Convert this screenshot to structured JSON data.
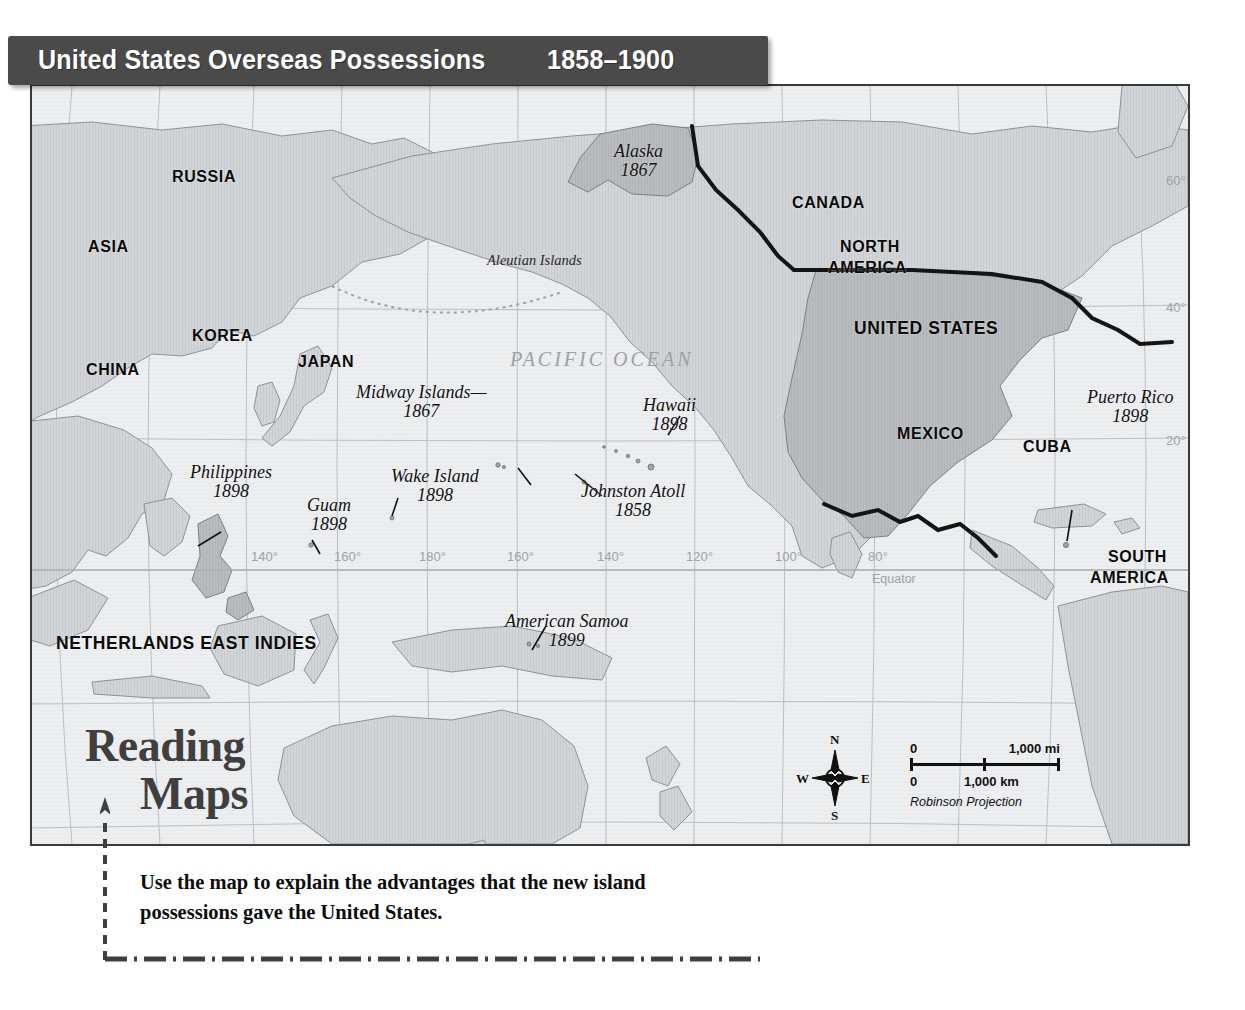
{
  "title": {
    "main": "United States Overseas Possessions",
    "years": "1858–1900"
  },
  "map": {
    "ocean_label": "PACIFIC OCEAN",
    "equator_label": "Equator",
    "projection": "Robinson Projection",
    "aleutian_label": "Aleutian Islands",
    "countries": [
      {
        "name": "RUSSIA",
        "x": 172,
        "y": 168
      },
      {
        "name": "ASIA",
        "x": 88,
        "y": 238
      },
      {
        "name": "KOREA",
        "x": 192,
        "y": 327
      },
      {
        "name": "CHINA",
        "x": 86,
        "y": 361
      },
      {
        "name": "JAPAN",
        "x": 298,
        "y": 353
      },
      {
        "name": "CANADA",
        "x": 792,
        "y": 194
      },
      {
        "name": "NORTH",
        "x": 840,
        "y": 238
      },
      {
        "name": "AMERICA",
        "x": 828,
        "y": 259
      },
      {
        "name": "UNITED STATES",
        "x": 854,
        "y": 318
      },
      {
        "name": "MEXICO",
        "x": 897,
        "y": 425
      },
      {
        "name": "CUBA",
        "x": 1023,
        "y": 438
      },
      {
        "name": "SOUTH",
        "x": 1108,
        "y": 548
      },
      {
        "name": "AMERICA",
        "x": 1090,
        "y": 569
      },
      {
        "name": "NETHERLANDS EAST INDIES",
        "x": 56,
        "y": 633
      }
    ],
    "possessions": [
      {
        "name": "Alaska",
        "year": "1867",
        "x": 614,
        "y": 142,
        "align": "center"
      },
      {
        "name": "Midway Islands—",
        "year": "1867",
        "x": 356,
        "y": 383,
        "align": "center"
      },
      {
        "name": "Hawaii",
        "year": "1898",
        "x": 643,
        "y": 396,
        "align": "center"
      },
      {
        "name": "Philippines",
        "year": "1898",
        "x": 190,
        "y": 463,
        "align": "center"
      },
      {
        "name": "Guam",
        "year": "1898",
        "x": 307,
        "y": 496,
        "align": "center"
      },
      {
        "name": "Wake Island",
        "year": "1898",
        "x": 391,
        "y": 467,
        "align": "center"
      },
      {
        "name": "Johnston Atoll",
        "year": "1858",
        "x": 581,
        "y": 482,
        "align": "center"
      },
      {
        "name": "American Samoa",
        "year": "1899",
        "x": 505,
        "y": 612,
        "align": "center"
      },
      {
        "name": "Puerto Rico",
        "year": "1898",
        "x": 1087,
        "y": 388,
        "align": "center"
      }
    ],
    "longitudes": [
      {
        "label": "140°",
        "x": 251,
        "y": 549
      },
      {
        "label": "160°",
        "x": 334,
        "y": 549
      },
      {
        "label": "180°",
        "x": 419,
        "y": 549
      },
      {
        "label": "160°",
        "x": 507,
        "y": 549
      },
      {
        "label": "140°",
        "x": 597,
        "y": 549
      },
      {
        "label": "120°",
        "x": 686,
        "y": 549
      },
      {
        "label": "100°",
        "x": 775,
        "y": 549
      },
      {
        "label": "80°",
        "x": 868,
        "y": 549
      }
    ],
    "latitudes": [
      {
        "label": "80°",
        "x": 1166,
        "y": 67
      },
      {
        "label": "60°",
        "x": 1166,
        "y": 173
      },
      {
        "label": "40°",
        "x": 1166,
        "y": 300
      },
      {
        "label": "20°",
        "x": 1166,
        "y": 433
      }
    ]
  },
  "scale": {
    "mi_zero": "0",
    "mi_value": "1,000 mi",
    "km_zero": "0",
    "km_value": "1,000 km"
  },
  "compass": {
    "n": "N",
    "s": "S",
    "e": "E",
    "w": "W"
  },
  "reading_maps": {
    "line1": "Reading",
    "line2": "Maps",
    "prompt": "Use the map to explain the advantages that the new island possessions gave the United States."
  },
  "colors": {
    "banner_bg": "#4a4a4a",
    "banner_text": "#ffffff",
    "ocean": "#eceef0",
    "land": "#d2d5d7",
    "us_land": "#b9bcbe",
    "graticule": "#b9bfc4",
    "border": "#3a3a3a",
    "heading": "#3f3f3f"
  }
}
